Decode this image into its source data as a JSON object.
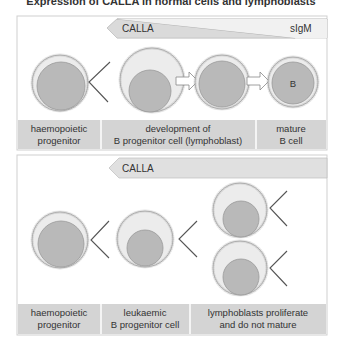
{
  "title": "Expression of CALLA in normal cells and lymphoblasts",
  "colors": {
    "panel_border": "#cfcfcf",
    "strip_fill": "#d4d4d4",
    "cytoplasm": "#ececec",
    "nucleus": "#b9b9b9",
    "bar_dark": "#d9d9d9",
    "bar_light": "#efefef",
    "text": "#333333"
  },
  "top_panel": {
    "bar": {
      "marker1": "CALLA",
      "marker2": "sIgM"
    },
    "cells": [
      {
        "name": "haemopoietic-progenitor",
        "label": ""
      },
      {
        "name": "b-progenitor-early",
        "label": ""
      },
      {
        "name": "b-progenitor-late",
        "label": ""
      },
      {
        "name": "mature-b-cell",
        "label": "B"
      }
    ],
    "labels": [
      {
        "line1": "haemopoietic",
        "line2": "progenitor"
      },
      {
        "line1": "development of",
        "line2": "B progenitor cell (lymphoblast)"
      },
      {
        "line1": "mature",
        "line2": "B cell"
      }
    ]
  },
  "bottom_panel": {
    "bar": {
      "marker1": "CALLA"
    },
    "labels": [
      {
        "line1": "haemopoietic",
        "line2": "progenitor"
      },
      {
        "line1": "leukaemic",
        "line2": "B progenitor cell"
      },
      {
        "line1": "lymphoblasts proliferate",
        "line2": "and do not mature"
      }
    ]
  }
}
